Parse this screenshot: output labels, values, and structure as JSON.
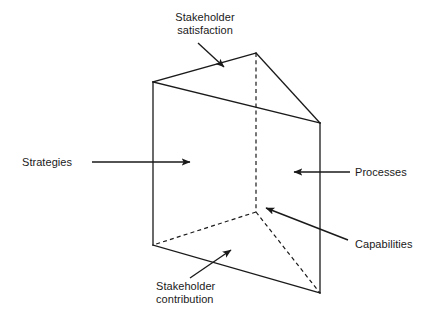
{
  "diagram": {
    "type": "3d-triangular-prism",
    "canvas": {
      "width": 433,
      "height": 320,
      "background": "#ffffff"
    },
    "stroke_color": "#1a1a1a",
    "text_color": "#1a1a1a",
    "labels": {
      "stakeholder_satisfaction": "Stakeholder\nsatisfaction",
      "strategies": "Strategies",
      "processes": "Processes",
      "capabilities": "Capabilities",
      "stakeholder_contribution": "Stakeholder\ncontribution"
    },
    "faces": [
      {
        "name": "stakeholder-satisfaction-face",
        "role": "top",
        "label_ref": "stakeholder_satisfaction"
      },
      {
        "name": "strategies-face",
        "role": "front-left",
        "label_ref": "strategies"
      },
      {
        "name": "processes-face",
        "role": "front-right",
        "label_ref": "processes"
      },
      {
        "name": "capabilities-edge",
        "role": "hidden-back-vertical-edge",
        "label_ref": "capabilities"
      },
      {
        "name": "stakeholder-contribution-face",
        "role": "bottom",
        "label_ref": "stakeholder_contribution"
      }
    ],
    "vertices": {
      "top_front_left": {
        "x": 153,
        "y": 82
      },
      "top_back_apex": {
        "x": 256,
        "y": 53
      },
      "top_front_right": {
        "x": 320,
        "y": 123
      },
      "bottom_front_left": {
        "x": 153,
        "y": 245
      },
      "bottom_back": {
        "x": 256,
        "y": 212
      },
      "bottom_front_right": {
        "x": 320,
        "y": 293
      }
    },
    "solid_edges": [
      {
        "name": "top-left-ridge",
        "from": [
          153,
          82
        ],
        "to": [
          256,
          53
        ]
      },
      {
        "name": "top-right-ridge",
        "from": [
          256,
          53
        ],
        "to": [
          320,
          123
        ]
      },
      {
        "name": "top-front-edge",
        "from": [
          153,
          82
        ],
        "to": [
          320,
          123
        ]
      },
      {
        "name": "left-vertical-edge",
        "from": [
          153,
          82
        ],
        "to": [
          153,
          245
        ]
      },
      {
        "name": "right-vertical-edge",
        "from": [
          320,
          123
        ],
        "to": [
          320,
          293
        ]
      },
      {
        "name": "bottom-front-edge",
        "from": [
          153,
          245
        ],
        "to": [
          320,
          293
        ]
      }
    ],
    "dashed_edges": [
      {
        "name": "back-vertical-edge",
        "from": [
          256,
          53
        ],
        "to": [
          256,
          212
        ]
      },
      {
        "name": "bottom-back-left-edge",
        "from": [
          256,
          212
        ],
        "to": [
          153,
          245
        ]
      },
      {
        "name": "bottom-back-right-edge",
        "from": [
          256,
          212
        ],
        "to": [
          320,
          293
        ]
      }
    ],
    "arrows": [
      {
        "name": "arrow-stakeholder-satisfaction",
        "from": [
          198,
          43
        ],
        "to": [
          225,
          68
        ],
        "points_to": "top-face"
      },
      {
        "name": "arrow-strategies",
        "from": [
          92,
          162
        ],
        "to": [
          192,
          162
        ],
        "points_to": "front-left-face"
      },
      {
        "name": "arrow-processes",
        "from": [
          350,
          172
        ],
        "to": [
          292,
          172
        ],
        "points_to": "front-right-face"
      },
      {
        "name": "arrow-capabilities",
        "from": [
          348,
          240
        ],
        "to": [
          264,
          207
        ],
        "points_to": "back-vertical-edge"
      },
      {
        "name": "arrow-stakeholder-contribution",
        "from": [
          190,
          278
        ],
        "to": [
          232,
          249
        ],
        "points_to": "bottom-face"
      }
    ]
  }
}
